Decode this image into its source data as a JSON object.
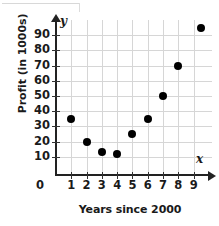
{
  "chart_data": {
    "type": "scatter",
    "title": "",
    "xlabel": "Years since 2000",
    "ylabel": "Profit (in 1000s)",
    "xlim": [
      0,
      10.2
    ],
    "ylim": [
      0,
      100
    ],
    "grid": true,
    "legend": null,
    "x_axis_variable": "x",
    "y_axis_variable": "y",
    "origin_label": "0",
    "xticks": [
      1,
      2,
      3,
      4,
      5,
      6,
      7,
      8,
      9
    ],
    "xtick_labels": [
      "1",
      "2",
      "3",
      "4",
      "5",
      "6",
      "7",
      "8",
      "9"
    ],
    "yticks": [
      10,
      20,
      30,
      40,
      50,
      60,
      70,
      80,
      90
    ],
    "ytick_labels": [
      "10",
      "20",
      "30",
      "40",
      "50",
      "60",
      "70",
      "80",
      "90"
    ],
    "series": [
      {
        "name": "Profit",
        "marker": "filled-circle",
        "color": "#000000",
        "points": [
          {
            "x": 1,
            "y": 35
          },
          {
            "x": 2,
            "y": 20
          },
          {
            "x": 3,
            "y": 13
          },
          {
            "x": 4,
            "y": 12
          },
          {
            "x": 5,
            "y": 25
          },
          {
            "x": 6,
            "y": 35
          },
          {
            "x": 7,
            "y": 50
          },
          {
            "x": 8,
            "y": 70
          },
          {
            "x": 9.5,
            "y": 95
          }
        ]
      }
    ],
    "colors": {
      "marker": "#000000",
      "axis": "#222222",
      "grid": "#d6d6d6",
      "text": "#1a1a1a",
      "background": "#ffffff"
    }
  }
}
